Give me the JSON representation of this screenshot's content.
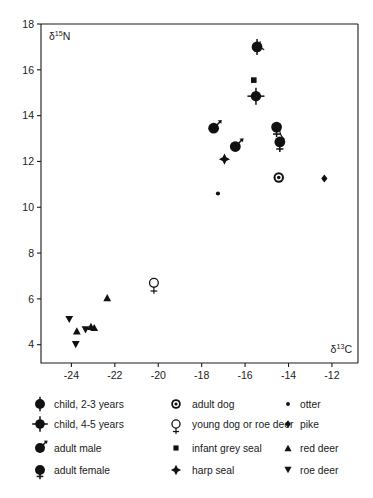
{
  "chart_data": {
    "type": "scatter",
    "title": "",
    "xlabel": "δ13C",
    "ylabel": "δ15N",
    "xlim": [
      -25.4,
      -10.8
    ],
    "ylim": [
      3.2,
      18
    ],
    "xticks": [
      -24,
      -22,
      -20,
      -18,
      -16,
      -14,
      -12
    ],
    "yticks": [
      4,
      6,
      8,
      10,
      12,
      14,
      16,
      18
    ],
    "xticklabels": [
      "-24",
      "-22",
      "-20",
      "-18",
      "-16",
      "-14",
      "-12"
    ],
    "yticklabels": [
      "4",
      "6",
      "8",
      "10",
      "12",
      "14",
      "16",
      "18"
    ],
    "grid": false,
    "legend_position": "below",
    "series": [
      {
        "name": "child, 2-3 years",
        "marker": "circle-bar",
        "points": [
          {
            "x": -15.45,
            "y": 17.0
          }
        ]
      },
      {
        "name": "child, 4-5 years",
        "marker": "circle-cross-bar",
        "points": [
          {
            "x": -15.5,
            "y": 14.85
          }
        ]
      },
      {
        "name": "adult male",
        "marker": "circle-arrow",
        "points": [
          {
            "x": -17.45,
            "y": 13.45
          },
          {
            "x": -16.45,
            "y": 12.65
          }
        ]
      },
      {
        "name": "adult female",
        "marker": "circle-female",
        "points": [
          {
            "x": -14.55,
            "y": 13.5
          },
          {
            "x": -14.4,
            "y": 12.85
          }
        ]
      },
      {
        "name": "adult dog",
        "marker": "circle-ringed",
        "points": [
          {
            "x": -14.45,
            "y": 11.3
          }
        ]
      },
      {
        "name": "young dog or roe deer",
        "marker": "circle-open-female",
        "points": [
          {
            "x": -20.2,
            "y": 6.7
          }
        ]
      },
      {
        "name": "infant grey seal",
        "marker": "square",
        "points": [
          {
            "x": -15.6,
            "y": 15.55
          }
        ]
      },
      {
        "name": "harp seal",
        "marker": "star4",
        "points": [
          {
            "x": -16.95,
            "y": 12.1
          }
        ]
      },
      {
        "name": "otter",
        "marker": "dot",
        "points": [
          {
            "x": -17.25,
            "y": 10.6
          }
        ]
      },
      {
        "name": "pike",
        "marker": "diamond",
        "points": [
          {
            "x": -12.35,
            "y": 11.25
          }
        ]
      },
      {
        "name": "red deer",
        "marker": "triangle-up",
        "points": [
          {
            "x": -22.35,
            "y": 6.05
          },
          {
            "x": -23.75,
            "y": 4.6
          },
          {
            "x": -23.1,
            "y": 4.8
          },
          {
            "x": -22.95,
            "y": 4.75
          }
        ]
      },
      {
        "name": "roe deer",
        "marker": "triangle-down",
        "points": [
          {
            "x": -24.1,
            "y": 5.1
          },
          {
            "x": -23.35,
            "y": 4.65
          },
          {
            "x": -23.8,
            "y": 4.0
          }
        ]
      }
    ]
  },
  "axes": {
    "ylabel_base": "δ",
    "ylabel_sup": "15",
    "ylabel_tail": "N",
    "xlabel_base": "δ",
    "xlabel_sup": "13",
    "xlabel_tail": "C"
  },
  "legend": {
    "columns": [
      [
        {
          "key": "child-2-3-years",
          "label": "child, 2-3 years",
          "marker": "circle-bar"
        },
        {
          "key": "child-4-5-years",
          "label": "child, 4-5 years",
          "marker": "circle-cross-bar"
        },
        {
          "key": "adult-male",
          "label": "adult male",
          "marker": "circle-arrow"
        },
        {
          "key": "adult-female",
          "label": "adult female",
          "marker": "circle-female"
        }
      ],
      [
        {
          "key": "adult-dog",
          "label": "adult dog",
          "marker": "circle-ringed"
        },
        {
          "key": "young-dog-or-roe-deer",
          "label": "young dog or roe deer",
          "marker": "circle-open-female"
        },
        {
          "key": "infant-grey-seal",
          "label": "infant grey seal",
          "marker": "square"
        },
        {
          "key": "harp-seal",
          "label": "harp seal",
          "marker": "star4"
        }
      ],
      [
        {
          "key": "otter",
          "label": "otter",
          "marker": "dot"
        },
        {
          "key": "pike",
          "label": "pike",
          "marker": "diamond"
        },
        {
          "key": "red-deer",
          "label": "red deer",
          "marker": "triangle-up"
        },
        {
          "key": "roe-deer",
          "label": "roe deer",
          "marker": "triangle-down"
        }
      ]
    ]
  },
  "colors": {
    "marker": "#111111",
    "axis": "#1a1a1a",
    "background": "#ffffff"
  }
}
